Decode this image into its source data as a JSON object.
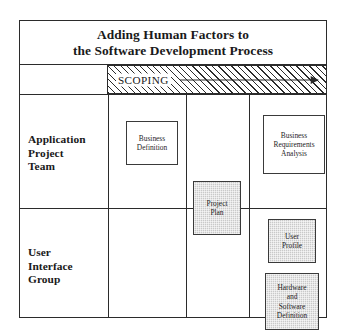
{
  "diagram": {
    "title_lines": [
      "Adding Human Factors to",
      "the Software Development Process"
    ],
    "phase_band": {
      "label": "SCOPING",
      "arrow_icon": "right-arrow-icon",
      "fill": "hatched"
    },
    "row_labels": [
      {
        "id": "application-project-team",
        "lines": [
          "Application",
          "Project",
          "Team"
        ]
      },
      {
        "id": "user-interface-group",
        "lines": [
          "User",
          "Interface",
          "Group"
        ]
      }
    ],
    "boxes": [
      {
        "id": "business-definition",
        "lines": [
          "Business",
          "Definition"
        ],
        "fill": "white",
        "row": "application-project-team",
        "column": 1
      },
      {
        "id": "business-requirements-analysis",
        "lines": [
          "Business",
          "Requirements",
          "Analysis"
        ],
        "fill": "white",
        "row": "application-project-team",
        "column": 3
      },
      {
        "id": "project-plan",
        "lines": [
          "Project",
          "Plan"
        ],
        "fill": "gray",
        "row": "spanning",
        "column": 2
      },
      {
        "id": "user-profile",
        "lines": [
          "User",
          "Profile"
        ],
        "fill": "gray",
        "row": "user-interface-group",
        "column": 3
      },
      {
        "id": "hardware-and-software-definition",
        "lines": [
          "Hardware",
          "and",
          "Software",
          "Definition"
        ],
        "fill": "gray",
        "row": "user-interface-group",
        "column": 3
      }
    ],
    "colors": {
      "line": "#2b2b2b",
      "box_border": "#3a3a3a",
      "gray_fill": "#c9c9c9",
      "white_fill": "#ffffff",
      "text": "#1a1a1a",
      "background": "#ffffff"
    }
  }
}
